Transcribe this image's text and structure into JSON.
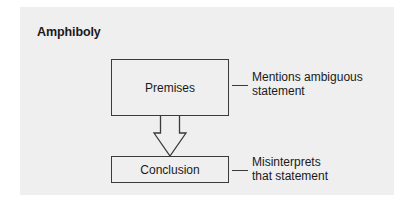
{
  "diagram": {
    "title": "Amphiboly",
    "nodes": [
      {
        "id": "premises",
        "label": "Premises",
        "note_line1": "Mentions ambiguous",
        "note_line2": "statement"
      },
      {
        "id": "conclusion",
        "label": "Conclusion",
        "note_line1": "Misinterprets",
        "note_line2": "that statement"
      }
    ],
    "edges": [
      {
        "from": "premises",
        "to": "conclusion",
        "style": "hollow-block-arrow"
      }
    ],
    "colors": {
      "background": "#efefef",
      "stroke": "#3a3a3a",
      "text": "#1a1a1a"
    }
  }
}
